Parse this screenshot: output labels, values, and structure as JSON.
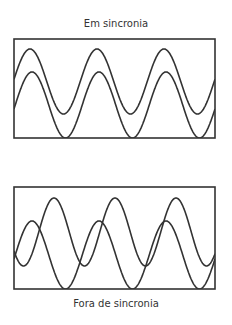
{
  "top_panel": {
    "label": "Em sincronia",
    "box": {
      "x": 14,
      "y": 39,
      "w": 201,
      "h": 99
    },
    "waves": [
      {
        "name": "upper",
        "peak_y": 49,
        "trough_y": 114,
        "first_peak_x": 30,
        "period": 67
      },
      {
        "name": "lower",
        "peak_y": 72,
        "trough_y": 138,
        "first_peak_x": 32,
        "period": 67
      }
    ]
  },
  "bottom_panel": {
    "label": "Fora de sincronia",
    "box": {
      "x": 14,
      "y": 187,
      "w": 201,
      "h": 102
    },
    "waves": [
      {
        "name": "high",
        "peak_y": 198,
        "trough_y": 266,
        "first_peak_x": 54,
        "period": 61
      },
      {
        "name": "low",
        "peak_y": 221,
        "trough_y": 289,
        "first_peak_x": 32,
        "period": 67
      }
    ]
  },
  "colors": {
    "stroke": "#333333",
    "text": "#333333"
  }
}
